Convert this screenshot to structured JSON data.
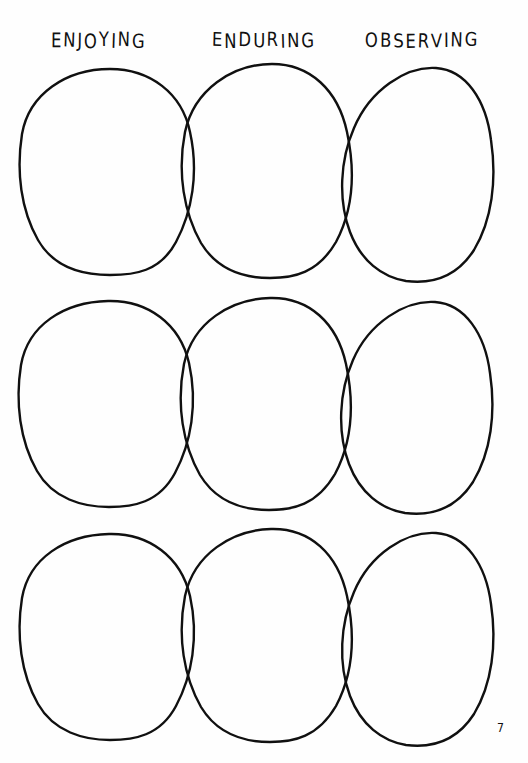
{
  "page": {
    "background_color": "#fefefe",
    "ink_color": "#101010",
    "width": 528,
    "height": 763,
    "page_number": "7"
  },
  "headings": [
    {
      "id": "enjoying",
      "label": "ENJOYING"
    },
    {
      "id": "enduring",
      "label": "ENDURING"
    },
    {
      "id": "observing",
      "label": "OBSERVING"
    }
  ],
  "diagram": {
    "type": "venn-chain",
    "row_count": 3,
    "ovals_per_row": 3,
    "rows": [
      {
        "id": "row-1",
        "label": "row-1"
      },
      {
        "id": "row-2",
        "label": "row-2"
      },
      {
        "id": "row-3",
        "label": "row-3"
      }
    ],
    "columns": [
      {
        "id": "col-enjoying",
        "heading": "ENJOYING"
      },
      {
        "id": "col-enduring",
        "heading": "ENDURING"
      },
      {
        "id": "col-observing",
        "heading": "OBSERVING"
      }
    ],
    "stroke_width": 2.4,
    "paths": {
      "row1_oval1": "M 110 9 C 150 9 182 33 190 72 C 199 113 192 152 176 182 C 160 212 134 215 110 215 C 84 215 54 208 38 180 C 21 150 16 112 22 74 C 29 34 66 9 110 9 Z",
      "row1_oval2": "M 272 4 C 310 4 338 30 347 72 C 356 114 352 152 336 182 C 318 213 294 218 270 218 C 244 218 218 211 201 183 C 184 153 177 113 185 72 C 194 30 232 4 272 4 Z",
      "row1_oval3": "M 436 8 C 466 10 486 40 491 80 C 497 120 492 160 474 190 C 456 218 430 224 406 221 C 382 217 361 201 350 172 C 338 140 340 100 354 68 C 370 30 406 6 436 8 Z",
      "row2_oval1": "M 108 8 C 148 7 180 31 189 70 C 198 111 191 150 175 180 C 159 210 133 214 109 214 C 83 214 53 206 37 178 C 20 148 15 110 21 72 C 28 32 64 9 108 8 Z",
      "row2_oval2": "M 270 5 C 309 4 337 30 346 71 C 355 113 351 151 335 181 C 317 212 293 217 269 217 C 243 217 217 210 200 182 C 183 152 176 112 184 71 C 193 29 231 6 270 5 Z",
      "row2_oval3": "M 435 9 C 465 11 485 41 490 80 C 496 120 491 159 473 189 C 455 217 429 223 405 220 C 381 216 360 200 349 171 C 337 139 339 99 353 67 C 369 30 405 7 435 9 Z",
      "row3_oval1": "M 109 9 C 149 8 181 32 190 71 C 199 112 192 151 176 181 C 160 211 134 215 110 215 C 84 215 54 207 38 179 C 21 149 16 111 22 73 C 29 33 65 10 109 9 Z",
      "row3_oval2": "M 271 4 C 310 3 338 29 347 71 C 356 113 352 151 336 181 C 318 212 294 217 270 217 C 244 217 218 210 201 182 C 184 152 177 112 185 71 C 194 29 232 5 271 4 Z",
      "row3_oval3": "M 436 8 C 466 10 486 40 491 79 C 497 119 492 159 474 189 C 456 217 430 223 406 220 C 382 216 361 200 350 171 C 338 139 340 99 354 67 C 370 29 406 6 436 8 Z"
    }
  }
}
